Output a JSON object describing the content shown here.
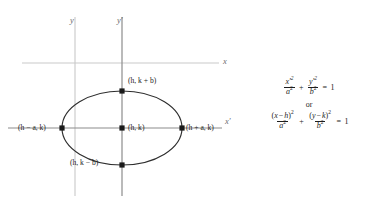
{
  "figure": {
    "type": "ellipse-translated-axes-diagram",
    "title": "",
    "axes": {
      "x_label": "x",
      "y_label": "y",
      "x_prime_label": "x′",
      "y_prime_label": "y′",
      "original_origin_px": {
        "x": 75,
        "y": 63
      },
      "translated_origin_px": {
        "x": 122,
        "y": 128
      },
      "axis_color": "#bdbdbd",
      "prime_axis_color": "#8e8e8e"
    },
    "ellipse": {
      "center_px": {
        "x": 122,
        "y": 128
      },
      "semi_major_px": 60,
      "semi_minor_px": 37,
      "stroke_color": "#2b2b2b",
      "stroke_width": 1.1,
      "center_label": "(h, k)",
      "right_vertex_label": "(h + a, k)",
      "left_vertex_label": "(h − a, k)",
      "top_covertex_label": "(h, k + b)",
      "bottom_covertex_label": "(h, k − b)"
    },
    "marker_points": [
      {
        "name": "center",
        "label": "(h, k)",
        "px": {
          "x": 122,
          "y": 128
        }
      },
      {
        "name": "right-vertex",
        "label": "(h + a, k)",
        "px": {
          "x": 182,
          "y": 128
        }
      },
      {
        "name": "left-vertex",
        "label": "(h − a, k)",
        "px": {
          "x": 62,
          "y": 128
        }
      },
      {
        "name": "top-covertex",
        "label": "(h, k + b)",
        "px": {
          "x": 122,
          "y": 91
        }
      },
      {
        "name": "bottom-covertex",
        "label": "(h, k − b)",
        "px": {
          "x": 122,
          "y": 165
        }
      }
    ]
  },
  "equations": {
    "first": {
      "term1_num": "x′",
      "term1_num_exp": "2",
      "term1_den": "a",
      "term1_den_exp": "2",
      "operator": "+",
      "term2_num": "y′",
      "term2_num_exp": "2",
      "term2_den": "b",
      "term2_den_exp": "2",
      "equals": "=",
      "rhs": "1"
    },
    "connector": "or",
    "second": {
      "term1_num_open": "(",
      "term1_num_var": "x",
      "term1_num_minus": "−",
      "term1_num_h": "h",
      "term1_num_close": ")",
      "term1_num_exp": "2",
      "term1_den": "a",
      "term1_den_exp": "2",
      "operator": "+",
      "term2_num_open": "(",
      "term2_num_var": "y",
      "term2_num_minus": "−",
      "term2_num_k": "k",
      "term2_num_close": ")",
      "term2_num_exp": "2",
      "term2_den": "b",
      "term2_den_exp": "2",
      "equals": "=",
      "rhs": "1"
    }
  }
}
